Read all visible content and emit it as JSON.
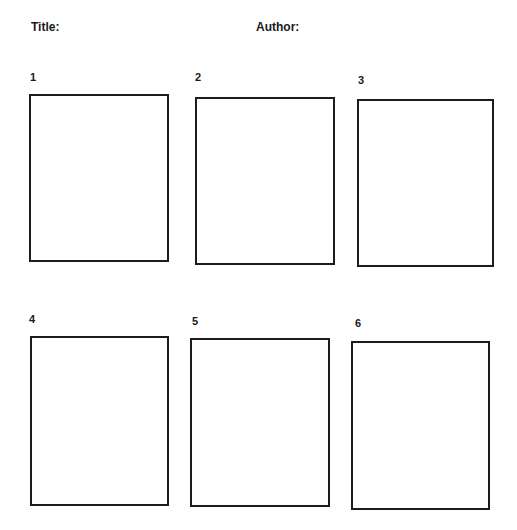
{
  "header": {
    "title_label": "Title:",
    "author_label": "Author:"
  },
  "panels": [
    {
      "number": "1"
    },
    {
      "number": "2"
    },
    {
      "number": "3"
    },
    {
      "number": "4"
    },
    {
      "number": "5"
    },
    {
      "number": "6"
    }
  ]
}
